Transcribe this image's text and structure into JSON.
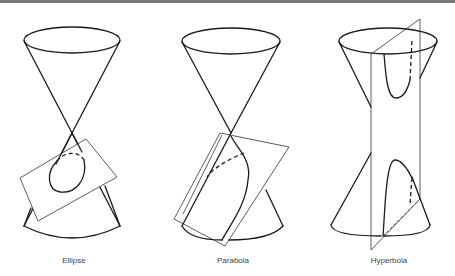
{
  "figure": {
    "panels": [
      {
        "id": "ellipse",
        "label": "Ellipse"
      },
      {
        "id": "parabola",
        "label": "Parabola"
      },
      {
        "id": "hyperbola",
        "label": "Hyperbola"
      }
    ]
  },
  "colors": {
    "line": "#1a1a1a",
    "plane": "#333333",
    "label": "#444444",
    "top_band": "#7a7a7a"
  }
}
